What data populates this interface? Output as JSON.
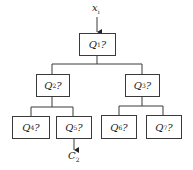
{
  "diagram": {
    "type": "decision-tree",
    "input": {
      "base": "x",
      "sub": "i"
    },
    "output": {
      "base": "C",
      "sub": "2"
    },
    "nodes": [
      {
        "id": "q1",
        "base": "Q",
        "sub": "1",
        "suffix": "?"
      },
      {
        "id": "q2",
        "base": "Q",
        "sub": "2",
        "suffix": "?"
      },
      {
        "id": "q3",
        "base": "Q",
        "sub": "3",
        "suffix": "?"
      },
      {
        "id": "q4",
        "base": "Q",
        "sub": "4",
        "suffix": "?"
      },
      {
        "id": "q5",
        "base": "Q",
        "sub": "5",
        "suffix": "?"
      },
      {
        "id": "q6",
        "base": "Q",
        "sub": "6",
        "suffix": "?"
      },
      {
        "id": "q7",
        "base": "Q",
        "sub": "7",
        "suffix": "?"
      }
    ],
    "edges": [
      [
        "q1",
        "q2"
      ],
      [
        "q1",
        "q3"
      ],
      [
        "q2",
        "q4"
      ],
      [
        "q2",
        "q5"
      ],
      [
        "q3",
        "q6"
      ],
      [
        "q3",
        "q7"
      ]
    ],
    "line_color": "#3a3a3a"
  }
}
